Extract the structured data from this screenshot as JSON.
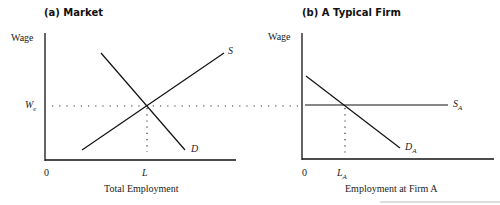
{
  "panels": [
    {
      "title": "(a) Market",
      "y_axis_label": "Wage",
      "x_axis_label": "Total Employment",
      "origin": "0",
      "wage_label": "W",
      "wage_sub": "e",
      "qty_label": "L",
      "supply_label": "S",
      "demand_label": "D"
    },
    {
      "title": "(b) A Typical Firm",
      "y_axis_label": "Wage",
      "x_axis_label": "Employment at Firm A",
      "origin": "0",
      "qty_label": "L",
      "qty_sub": "A",
      "supply_label": "S",
      "supply_sub": "A",
      "demand_label": "D",
      "demand_sub": "A"
    }
  ],
  "colors": {
    "line": "#111111",
    "text": "#222222"
  }
}
